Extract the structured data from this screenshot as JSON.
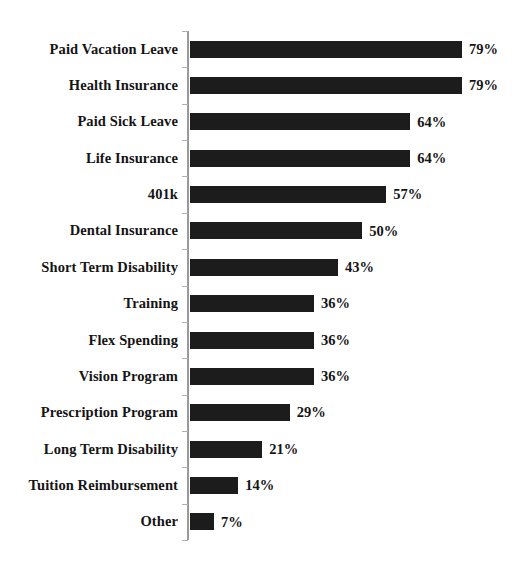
{
  "chart_data": {
    "type": "bar",
    "orientation": "horizontal",
    "title": "",
    "subtitle": "",
    "xlabel": "",
    "ylabel": "",
    "xlim": [
      0,
      100
    ],
    "grid": false,
    "legend": null,
    "value_suffix": "%",
    "bar_color": "#1c1c1c",
    "axis_color": "#9a9a9a",
    "background_color": "#ffffff",
    "categories": [
      "Paid Vacation Leave",
      "Health Insurance",
      "Paid Sick Leave",
      "Life Insurance",
      "401k",
      "Dental Insurance",
      "Short Term Disability",
      "Training",
      "Flex Spending",
      "Vision Program",
      "Prescription Program",
      "Long Term Disability",
      "Tuition Reimbursement",
      "Other"
    ],
    "values": [
      79,
      79,
      64,
      64,
      57,
      50,
      43,
      36,
      36,
      36,
      29,
      21,
      14,
      7
    ],
    "value_labels": [
      "79%",
      "79%",
      "64%",
      "64%",
      "57%",
      "50%",
      "43%",
      "36%",
      "36%",
      "36%",
      "29%",
      "21%",
      "14%",
      "7%"
    ]
  }
}
